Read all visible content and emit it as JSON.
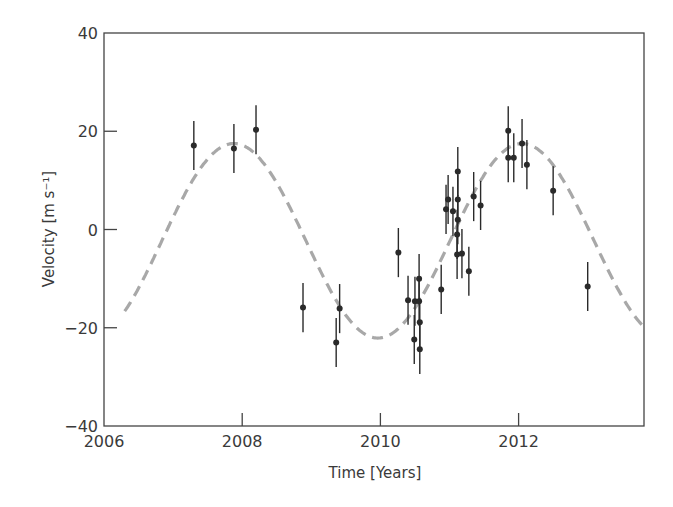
{
  "chart_data": {
    "type": "scatter",
    "title": "",
    "xlabel": "Time [Years]",
    "ylabel": "Velocity [m s⁻¹]",
    "xlim": [
      2006,
      2013.8
    ],
    "ylim": [
      -40,
      40
    ],
    "xticks": [
      2006,
      2008,
      2010,
      2012
    ],
    "yticks": [
      -40,
      -20,
      0,
      20,
      40
    ],
    "grid": false,
    "legend": null,
    "series": [
      {
        "name": "Observed radial velocity",
        "style": "points-with-errorbars",
        "color": "#2a2a2a",
        "points": [
          {
            "x": 2007.3,
            "y": 17.1,
            "err": 5.0
          },
          {
            "x": 2007.88,
            "y": 16.5,
            "err": 5.0
          },
          {
            "x": 2008.2,
            "y": 20.3,
            "err": 5.0
          },
          {
            "x": 2008.88,
            "y": -15.9,
            "err": 5.0
          },
          {
            "x": 2009.36,
            "y": -23.0,
            "err": 5.0
          },
          {
            "x": 2009.41,
            "y": -16.1,
            "err": 5.0
          },
          {
            "x": 2010.26,
            "y": -4.7,
            "err": 5.0
          },
          {
            "x": 2010.4,
            "y": -14.4,
            "err": 5.0
          },
          {
            "x": 2010.49,
            "y": -22.4,
            "err": 5.0
          },
          {
            "x": 2010.5,
            "y": -14.6,
            "err": 5.0
          },
          {
            "x": 2010.56,
            "y": -10.0,
            "err": 5.0
          },
          {
            "x": 2010.56,
            "y": -14.6,
            "err": 5.0
          },
          {
            "x": 2010.57,
            "y": -18.9,
            "err": 5.0
          },
          {
            "x": 2010.57,
            "y": -24.4,
            "err": 5.0
          },
          {
            "x": 2010.88,
            "y": -12.2,
            "err": 5.0
          },
          {
            "x": 2010.95,
            "y": 4.1,
            "err": 5.0
          },
          {
            "x": 2010.98,
            "y": 6.1,
            "err": 5.0
          },
          {
            "x": 2011.05,
            "y": 3.7,
            "err": 5.0
          },
          {
            "x": 2011.12,
            "y": 11.8,
            "err": 5.0
          },
          {
            "x": 2011.12,
            "y": 6.1,
            "err": 5.0
          },
          {
            "x": 2011.12,
            "y": 2.0,
            "err": 5.0
          },
          {
            "x": 2011.11,
            "y": -1.0,
            "err": 5.0
          },
          {
            "x": 2011.11,
            "y": -5.1,
            "err": 5.0
          },
          {
            "x": 2011.18,
            "y": -4.9,
            "err": 5.0
          },
          {
            "x": 2011.28,
            "y": -8.5,
            "err": 5.0
          },
          {
            "x": 2011.35,
            "y": 6.7,
            "err": 5.0
          },
          {
            "x": 2011.45,
            "y": 4.9,
            "err": 5.0
          },
          {
            "x": 2011.85,
            "y": 14.6,
            "err": 5.0
          },
          {
            "x": 2011.85,
            "y": 20.1,
            "err": 5.0
          },
          {
            "x": 2011.93,
            "y": 14.6,
            "err": 5.0
          },
          {
            "x": 2012.05,
            "y": 17.5,
            "err": 5.0
          },
          {
            "x": 2012.12,
            "y": 13.2,
            "err": 5.0
          },
          {
            "x": 2012.5,
            "y": 7.9,
            "err": 5.0
          },
          {
            "x": 2013.0,
            "y": -11.6,
            "err": 5.0
          }
        ]
      },
      {
        "name": "Sinusoidal fit",
        "style": "dashed-line",
        "color": "#a8a8a8",
        "model": {
          "type": "sine",
          "amplitude": 19.8,
          "offset": -2.3,
          "period": 4.17,
          "peak_time": 2007.88
        },
        "x_range": [
          2006.3,
          2013.8
        ]
      }
    ]
  }
}
